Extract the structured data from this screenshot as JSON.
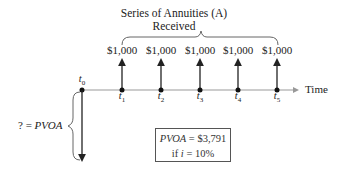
{
  "diagram": {
    "title_line1": "Series of Annuities (A)",
    "title_line2": "Received",
    "payments": [
      "$1,000",
      "$1,000",
      "$1,000",
      "$1,000",
      "$1,000"
    ],
    "t0_label": "t",
    "t0_sub": "0",
    "periods": [
      {
        "label": "t",
        "sub": "1"
      },
      {
        "label": "t",
        "sub": "2"
      },
      {
        "label": "t",
        "sub": "3"
      },
      {
        "label": "t",
        "sub": "4"
      },
      {
        "label": "t",
        "sub": "5"
      }
    ],
    "axis_label": "Time",
    "pv_prefix": "? = ",
    "pv_label": "PVOA",
    "result_line1_var": "PVOA",
    "result_line1_val": " = $3,791",
    "result_line2_prefix": "if ",
    "result_line2_var": "i",
    "result_line2_val": " = 10%"
  }
}
